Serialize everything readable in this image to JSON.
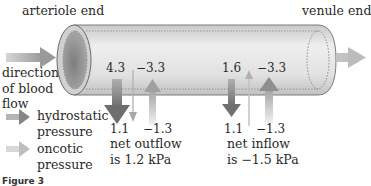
{
  "labels": {
    "arteriole_end": "arteriole end",
    "venule_end": "venule end",
    "direction_line1": "direction",
    "direction_line2": "of blood",
    "direction_line3": "flow"
  },
  "legend": {
    "hydrostatic_line1": "hydrostatic",
    "hydrostatic_line2": "pressure",
    "oncotic_line1": "oncotic",
    "oncotic_line2": "pressure",
    "hydrostatic_color": "#8a8a8a",
    "oncotic_color": "#c4c4c4"
  },
  "arteriole_side": {
    "capillary_hydrostatic": "4.3",
    "capillary_oncotic": "−3.3",
    "tissue_hydrostatic": "1.1",
    "tissue_oncotic": "−1.3",
    "net_line1": "net outflow",
    "net_line2": "is 1.2 kPa"
  },
  "venule_side": {
    "capillary_hydrostatic": "1.6",
    "capillary_oncotic": "−3.3",
    "tissue_hydrostatic": "1.1",
    "tissue_oncotic": "−1.3",
    "net_line1": "net inflow",
    "net_line2": "is −1.5 kPa"
  },
  "caption": {
    "text": "Figure 3"
  },
  "colors": {
    "tube_fill": "#dcdcdc",
    "tube_outline": "#7a7a7a",
    "lumen_dark": "#8c8c8c",
    "flow_arrow": "#a8a8a8"
  }
}
